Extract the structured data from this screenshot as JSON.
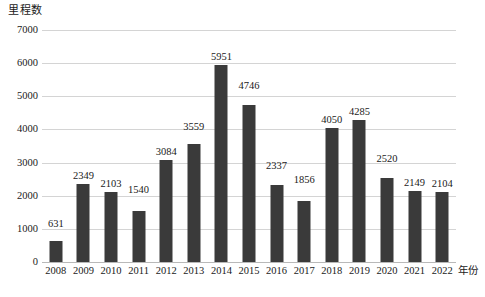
{
  "chart_data": {
    "type": "bar",
    "title": "",
    "ylabel": "里程数",
    "xlabel": "年份",
    "categories": [
      "2008",
      "2009",
      "2010",
      "2011",
      "2012",
      "2013",
      "2014",
      "2015",
      "2016",
      "2017",
      "2018",
      "2019",
      "2020",
      "2021",
      "2022"
    ],
    "values": [
      631,
      2349,
      2103,
      1540,
      3084,
      3559,
      5951,
      4746,
      2337,
      1856,
      4050,
      4285,
      2520,
      2149,
      2104
    ],
    "ylim": [
      0,
      7000
    ],
    "yticks": [
      0,
      1000,
      2000,
      3000,
      4000,
      5000,
      6000,
      7000
    ],
    "ytick_labels": [
      "0",
      "1000",
      "2000",
      "3000",
      "4000",
      "5000",
      "6000",
      "7000"
    ],
    "grid": true,
    "grid_axis": "y",
    "legend": false,
    "data_labels": true,
    "bar_color": "#3a3a3a",
    "gridline_color": "#d4d4d4",
    "axis_color": "#b9b9b9",
    "background": "#ffffff"
  },
  "caption": "",
  "accent": "#3a3a3a"
}
